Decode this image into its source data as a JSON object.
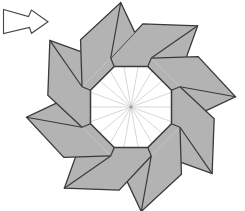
{
  "figure": {
    "kind": "origami pinwheel / octagonal twist diagram",
    "blade_count": 8,
    "crease_spoke_count": 18,
    "arrow": {
      "icon": "right-arrow-icon",
      "direction": "right"
    }
  },
  "colors": {
    "background": "#ffffff",
    "paper": "#b3b3b3",
    "outline": "#3a3a3a",
    "center_face": "#ffffff",
    "spoke": "#d2d2d2",
    "center_point": "#9a9a9a",
    "arrow_fill": "#ffffff",
    "arrow_stroke": "#444444"
  }
}
